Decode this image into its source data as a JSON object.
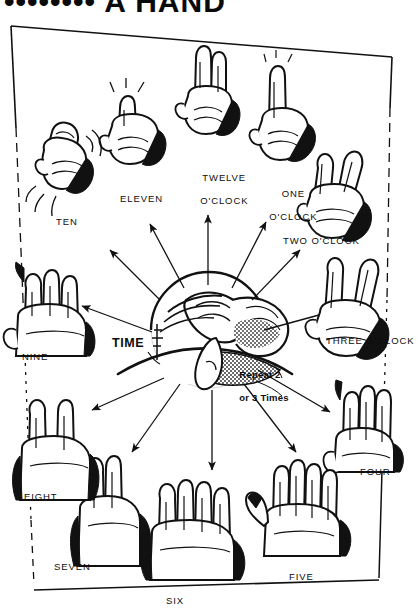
{
  "page": {
    "title_clipped": "•••••••• A HAND",
    "background_color": "#ffffff",
    "ink_color": "#0d0d0d",
    "width": 417,
    "height": 613
  },
  "center": {
    "time_label": "TIME",
    "repeat_note_line1": "Repeat 2",
    "repeat_note_line2": "or 3 Times",
    "illustration_name": "hand-massaging-wrist"
  },
  "clock_positions": [
    {
      "id": "twelve",
      "label_line1": "TWELVE",
      "label_line2": "O'CLOCK",
      "hand": "index-finger-pointing-up"
    },
    {
      "id": "one",
      "label_line1": "ONE",
      "label_line2": "O'CLOCK",
      "hand": "index-finger-up-fist"
    },
    {
      "id": "two",
      "label_line1": "TWO O'CLOCK",
      "label_line2": "",
      "hand": "two-fingers-v-tilted"
    },
    {
      "id": "three",
      "label_line1": "THREE O'CLOCK",
      "label_line2": "",
      "hand": "two-fingers-v-open"
    },
    {
      "id": "four",
      "label_line1": "FOUR",
      "label_line2": "",
      "hand": "four-fingers-up"
    },
    {
      "id": "five",
      "label_line1": "FIVE",
      "label_line2": "",
      "hand": "open-hand-thumb-out"
    },
    {
      "id": "six",
      "label_line1": "SIX",
      "label_line2": "",
      "hand": "open-hand-fingers-spread"
    },
    {
      "id": "seven",
      "label_line1": "SEVEN",
      "label_line2": "",
      "hand": "two-fingers-upright"
    },
    {
      "id": "eight",
      "label_line1": "EIGHT",
      "label_line2": "",
      "hand": "two-fingers-spread"
    },
    {
      "id": "nine",
      "label_line1": "NINE",
      "label_line2": "",
      "hand": "three-fingers-up"
    },
    {
      "id": "ten",
      "label_line1": "TEN",
      "label_line2": "",
      "hand": "curled-hand-shaking"
    },
    {
      "id": "eleven",
      "label_line1": "ELEVEN",
      "label_line2": "",
      "hand": "fist-thumb-up"
    }
  ]
}
